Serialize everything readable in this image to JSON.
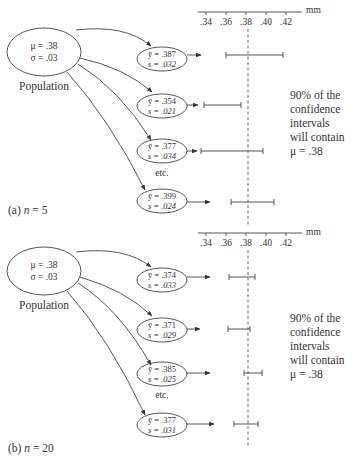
{
  "panels": [
    {
      "id": "a",
      "caption_prefix": "(a) ",
      "caption_n": "n",
      "caption_suffix": " = 5",
      "population": {
        "mu_label": "μ = .38",
        "sigma_label": "σ = .03",
        "name": "Population"
      },
      "axis": {
        "unit": "mm",
        "ticks": [
          ".34",
          ".36",
          ".38",
          ".40",
          ".42"
        ]
      },
      "samples": [
        {
          "ybar_label": "ȳ = .387",
          "s_label": "s = .032",
          "ci": [
            0.36,
            0.417
          ]
        },
        {
          "ybar_label": "ȳ = .354",
          "s_label": "s = .021",
          "ci": [
            0.338,
            0.375
          ]
        },
        {
          "ybar_label": "ȳ = .377",
          "s_label": "s = .034",
          "ci": [
            0.335,
            0.397
          ]
        },
        {
          "ybar_label": "ȳ = .399",
          "s_label": "s = .024",
          "ci": [
            0.365,
            0.408
          ]
        }
      ],
      "etc_label": "etc.",
      "note_lines": [
        "90% of the",
        "confidence",
        "intervals",
        "will contain",
        "μ = .38"
      ]
    },
    {
      "id": "b",
      "caption_prefix": "(b) ",
      "caption_n": "n",
      "caption_suffix": " = 20",
      "population": {
        "mu_label": "μ = .38",
        "sigma_label": "σ = .03",
        "name": "Population"
      },
      "axis": {
        "unit": "mm",
        "ticks": [
          ".34",
          ".36",
          ".38",
          ".40",
          ".42"
        ]
      },
      "samples": [
        {
          "ybar_label": "ȳ = .374",
          "s_label": "s = .033",
          "ci": [
            0.363,
            0.389
          ]
        },
        {
          "ybar_label": "ȳ = .371",
          "s_label": "s = .029",
          "ci": [
            0.362,
            0.384
          ]
        },
        {
          "ybar_label": "ȳ = .385",
          "s_label": "s = .025",
          "ci": [
            0.378,
            0.396
          ]
        },
        {
          "ybar_label": "ȳ = .377",
          "s_label": "s = .031",
          "ci": [
            0.368,
            0.392
          ]
        }
      ],
      "etc_label": "etc.",
      "note_lines": [
        "90% of the",
        "confidence",
        "intervals",
        "will contain",
        "μ = .38"
      ]
    }
  ],
  "true_mean": 0.38
}
